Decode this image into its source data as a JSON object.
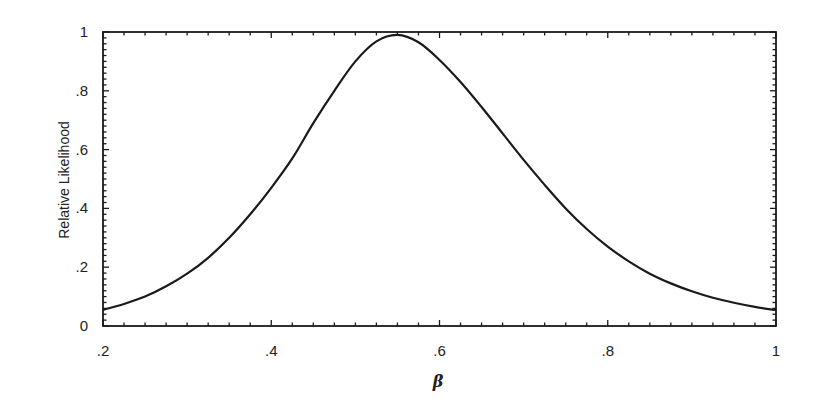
{
  "chart_data": {
    "type": "line",
    "title": "",
    "xlabel": "β",
    "ylabel": "Relative Likelihood",
    "xlim": [
      0.2,
      1.0
    ],
    "ylim": [
      0,
      1
    ],
    "grid": false,
    "legend": null,
    "x_ticks": [
      0.2,
      0.4,
      0.6,
      0.8,
      1.0
    ],
    "x_tick_labels": [
      ".2",
      ".4",
      ".6",
      ".8",
      "1"
    ],
    "x_minor_step": 0.025,
    "y_ticks": [
      0,
      0.2,
      0.4,
      0.6,
      0.8,
      1.0
    ],
    "y_tick_labels": [
      "0",
      ".2",
      ".4",
      ".6",
      ".8",
      "1"
    ],
    "y_minor_step": 0.04,
    "series": [
      {
        "name": "Relative Likelihood",
        "color": "#1a1a1a",
        "x": [
          0.2,
          0.225,
          0.25,
          0.275,
          0.3,
          0.325,
          0.35,
          0.375,
          0.4,
          0.425,
          0.45,
          0.475,
          0.5,
          0.525,
          0.55,
          0.575,
          0.6,
          0.625,
          0.65,
          0.675,
          0.7,
          0.725,
          0.75,
          0.775,
          0.8,
          0.825,
          0.85,
          0.875,
          0.9,
          0.925,
          0.95,
          0.975,
          1.0
        ],
        "values": [
          0.055,
          0.075,
          0.1,
          0.135,
          0.178,
          0.232,
          0.3,
          0.38,
          0.47,
          0.57,
          0.69,
          0.8,
          0.9,
          0.968,
          0.99,
          0.965,
          0.905,
          0.83,
          0.745,
          0.655,
          0.565,
          0.48,
          0.4,
          0.33,
          0.27,
          0.22,
          0.178,
          0.145,
          0.118,
          0.096,
          0.079,
          0.065,
          0.054
        ]
      }
    ],
    "peak": {
      "x": 0.553,
      "y": 0.99
    }
  },
  "labels": {
    "ylabel": "Relative Likelihood",
    "xlabel": "β"
  },
  "colors": {
    "background": "#ffffff",
    "axis": "#1a1a1a",
    "curve": "#1a1a1a"
  }
}
